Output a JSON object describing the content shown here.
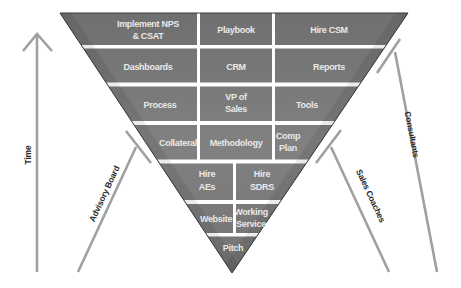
{
  "diagram": {
    "type": "inverted-pyramid",
    "colors": {
      "cell_fill": "#7a7a7a",
      "cell_border": "#ffffff",
      "cell_text": "#ececec",
      "pyramid_outline": "#3a3a3a",
      "support_lines": "#a0a0a0",
      "label_text": "#2a2a2a"
    },
    "rows": [
      {
        "cells": [
          {
            "label_lines": [
              "Implement NPS",
              "& CSAT"
            ]
          },
          {
            "label_lines": [
              "Playbook"
            ]
          },
          {
            "label_lines": [
              "Hire CSM"
            ]
          }
        ]
      },
      {
        "cells": [
          {
            "label_lines": [
              "Dashboards"
            ]
          },
          {
            "label_lines": [
              "CRM"
            ]
          },
          {
            "label_lines": [
              "Reports"
            ]
          }
        ]
      },
      {
        "cells": [
          {
            "label_lines": [
              "Process"
            ]
          },
          {
            "label_lines": [
              "VP of",
              "Sales"
            ]
          },
          {
            "label_lines": [
              "Tools"
            ]
          }
        ]
      },
      {
        "cells": [
          {
            "label_lines": [
              "Collateral"
            ]
          },
          {
            "label_lines": [
              "Methodology"
            ]
          },
          {
            "label_lines": [
              "Comp",
              "Plan"
            ]
          }
        ]
      },
      {
        "cells": [
          {
            "label_lines": [
              "Hire",
              "AEs"
            ]
          },
          {
            "label_lines": [
              "Hire",
              "SDRS"
            ]
          }
        ]
      },
      {
        "cells": [
          {
            "label_lines": [
              "Website"
            ]
          },
          {
            "label_lines": [
              "Working",
              "Service"
            ]
          }
        ]
      },
      {
        "cells": [
          {
            "label_lines": [
              "Pitch"
            ]
          }
        ]
      }
    ],
    "axis": {
      "label": "Time",
      "icon": "arrow-up-icon"
    },
    "supports": [
      {
        "label": "Advisory Board",
        "side": "left"
      },
      {
        "label": "Sales Coaches",
        "side": "right"
      },
      {
        "label": "Consultants",
        "side": "right-outer"
      }
    ]
  }
}
